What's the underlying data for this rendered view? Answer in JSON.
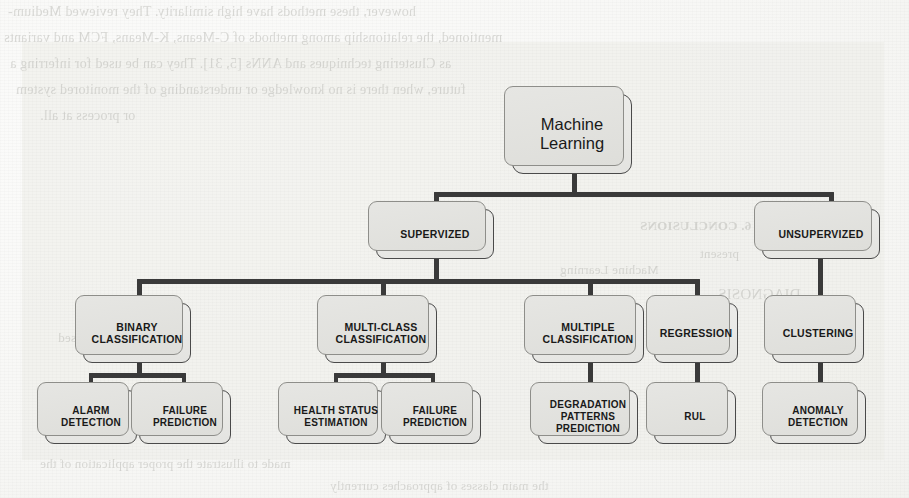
{
  "figure": {
    "type": "tree-diagram",
    "root": {
      "id": "root",
      "label": "Machine\nLearning"
    },
    "levels": [
      {
        "name": "paradigm",
        "nodes": [
          {
            "id": "supervized",
            "label": "SUPERVIZED"
          },
          {
            "id": "unsupervized",
            "label": "UNSUPERVIZED"
          }
        ]
      },
      {
        "name": "task",
        "nodes": [
          {
            "id": "binary-classification",
            "label": "BINARY\nCLASSIFICATION",
            "parent": "supervized"
          },
          {
            "id": "multi-class-classification",
            "label": "MULTI-CLASS\nCLASSIFICATION",
            "parent": "supervized"
          },
          {
            "id": "multiple-classification",
            "label": "MULTIPLE\nCLASSIFICATION",
            "parent": "supervized"
          },
          {
            "id": "regression",
            "label": "REGRESSION",
            "parent": "supervized"
          },
          {
            "id": "clustering",
            "label": "CLUSTERING",
            "parent": "unsupervized"
          }
        ]
      },
      {
        "name": "application",
        "nodes": [
          {
            "id": "alarm-detection",
            "label": "ALARM\nDETECTION",
            "parent": "binary-classification"
          },
          {
            "id": "failure-prediction-1",
            "label": "FAILURE\nPREDICTION",
            "parent": "binary-classification"
          },
          {
            "id": "health-status-estimation",
            "label": "HEALTH STATUS\nESTIMATION",
            "parent": "multi-class-classification"
          },
          {
            "id": "failure-prediction-2",
            "label": "FAILURE\nPREDICTION",
            "parent": "multi-class-classification"
          },
          {
            "id": "degradation-patterns-prediction",
            "label": "DEGRADATION\nPATTERNS\nPREDICTION",
            "parent": "multiple-classification"
          },
          {
            "id": "rul",
            "label": "RUL",
            "parent": "regression"
          },
          {
            "id": "anomaly-detection",
            "label": "ANOMALY\nDETECTION",
            "parent": "clustering"
          }
        ]
      }
    ],
    "colors": {
      "node_fill": "#eeeeec",
      "node_border": "#4a4a4a",
      "shadow_card": "#e6e6e3",
      "connector": "#3a3a3a",
      "panel": "#ececE8",
      "page": "#fbfbfa",
      "bleed_text": "#b9b9b4"
    }
  },
  "background_text": {
    "note": "faint show-through text from the reverse of the scanned page",
    "lines": [
      {
        "id": "bl-1",
        "text": "however, these methods have high similarity. They reviewed Medium-"
      },
      {
        "id": "bl-2",
        "text": "mentioned, the relationship among methods of C-Means, K-Means, FCM and variants"
      },
      {
        "id": "bl-3",
        "text": "as Clustering techniques and ANNs [5, 31]. They can be used for inferring a"
      },
      {
        "id": "bl-4",
        "text": "future, when there is no knowledge or understanding of the monitored system"
      },
      {
        "id": "bl-5",
        "text": "or process at all."
      },
      {
        "id": "bl-6",
        "text": "6. CONCLUSIONS"
      },
      {
        "id": "bl-7",
        "text": "present"
      },
      {
        "id": "bl-8",
        "text": "Machine Learning"
      },
      {
        "id": "bl-9",
        "text": "DIAGNOSIS"
      },
      {
        "id": "bl-10",
        "text": "model-based"
      },
      {
        "id": "bl-11",
        "text": "made to illustrate the proper application of the"
      },
      {
        "id": "bl-12",
        "text": "the main classes of approaches currently"
      }
    ]
  }
}
